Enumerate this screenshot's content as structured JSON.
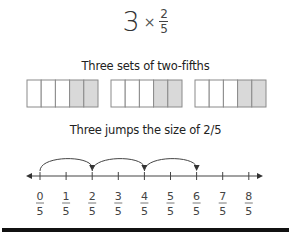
{
  "expression": {
    "whole": "3",
    "operator": "×",
    "numerator": "2",
    "denominator": "5"
  },
  "bar_model": {
    "caption": "Three sets of two-fifths",
    "sets": 3,
    "parts_per_set": 5,
    "shaded_parts_per_set": 2,
    "shade_color": "#d9d9d9",
    "outline_color": "#8a8a8a"
  },
  "number_line": {
    "caption": "Three jumps the size of 2/5",
    "ticks": [
      {
        "num": "0",
        "den": "5"
      },
      {
        "num": "1",
        "den": "5"
      },
      {
        "num": "2",
        "den": "5"
      },
      {
        "num": "3",
        "den": "5"
      },
      {
        "num": "4",
        "den": "5"
      },
      {
        "num": "5",
        "den": "5"
      },
      {
        "num": "6",
        "den": "5"
      },
      {
        "num": "7",
        "den": "5"
      },
      {
        "num": "8",
        "den": "5"
      }
    ],
    "jumps": [
      [
        0,
        2
      ],
      [
        2,
        4
      ],
      [
        4,
        6
      ]
    ],
    "line_color": "#444444"
  }
}
